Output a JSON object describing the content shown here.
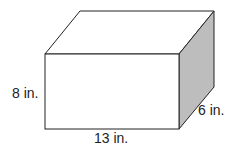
{
  "diagram": {
    "shape": "rectangular prism",
    "colors": {
      "edge": "#222222",
      "front": "#ffffff",
      "top": "#ffffff",
      "side": "#bdbdbd"
    },
    "labels": {
      "height": "8 in.",
      "depth": "6 in.",
      "length": "13 in."
    }
  }
}
